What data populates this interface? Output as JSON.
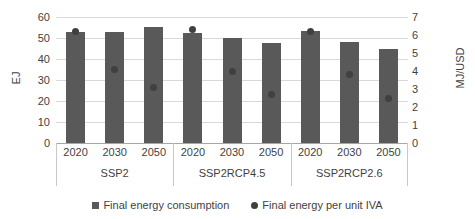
{
  "chart_data": {
    "type": "bar",
    "title": "",
    "categories": [
      "2020",
      "2030",
      "2050",
      "2020",
      "2030",
      "2050",
      "2020",
      "2030",
      "2050"
    ],
    "group_labels": [
      "SSP2",
      "SSP2RCP4.5",
      "SSP2RCP2.6"
    ],
    "series": [
      {
        "name": "Final energy consumption",
        "marker": "square",
        "axis": "left",
        "unit": "EJ",
        "values": [
          53.0,
          52.9,
          55.2,
          52.4,
          50.0,
          47.6,
          53.3,
          48.1,
          44.8
        ]
      },
      {
        "name": "Final energy per unit IVA",
        "marker": "circle",
        "axis": "right",
        "unit": "MJ/USD",
        "values": [
          6.2,
          4.1,
          3.1,
          6.3,
          4.0,
          2.7,
          6.2,
          3.8,
          2.5
        ]
      }
    ],
    "xlabel": "",
    "ylabel": "EJ",
    "y2label": "MJ/USD",
    "ylim": [
      0,
      60
    ],
    "yticks": [
      "0",
      "10",
      "20",
      "30",
      "40",
      "50",
      "60"
    ],
    "y2lim": [
      0,
      7
    ],
    "y2ticks": [
      "0",
      "1",
      "2",
      "3",
      "4",
      "5",
      "6",
      "7"
    ],
    "grid": true,
    "legend_position": "bottom",
    "colors": {
      "bar": "#595959",
      "dot": "#404040",
      "gridline": "#d9d9d9",
      "axis": "#a6a6a6",
      "text": "#3f3f3f"
    }
  },
  "legend": {
    "items": [
      {
        "label": "Final energy consumption",
        "marker": "square"
      },
      {
        "label": "Final energy per unit IVA",
        "marker": "circle"
      }
    ]
  },
  "axes": {
    "left_title": "EJ",
    "right_title": "MJ/USD"
  }
}
